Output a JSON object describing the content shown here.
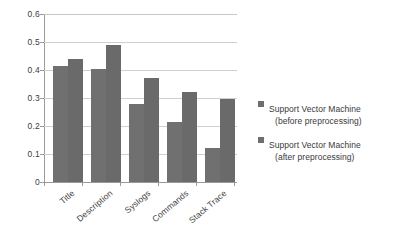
{
  "chart_data": {
    "type": "bar",
    "title": "",
    "xlabel": "",
    "ylabel": "",
    "categories": [
      "Title",
      "Description",
      "Syslogs",
      "Commands",
      "Stack Trace"
    ],
    "series": [
      {
        "name": "Support Vector Machine (before preprocessing)",
        "values": [
          0.415,
          0.405,
          0.28,
          0.215,
          0.12
        ]
      },
      {
        "name": "Support Vector Machine (after preprocessing)",
        "values": [
          0.44,
          0.49,
          0.37,
          0.32,
          0.295
        ]
      }
    ],
    "ylim": [
      0,
      0.6
    ],
    "ytick_labels": [
      "0.6",
      "0.5",
      "0.4",
      "0.3",
      "0.2",
      "0.1",
      "0"
    ],
    "ytick_values": [
      0.6,
      0.5,
      0.4,
      0.3,
      0.2,
      0.1,
      0
    ],
    "grid": true,
    "grid_axis": "y",
    "legend_position": "right",
    "bar_color": "#6e6e6e",
    "grid_color": "#cfcfcf",
    "axis_color": "#9a9a9a"
  },
  "legend": {
    "entries": [
      {
        "line1": "Support Vector Machine",
        "line2": "(before preprocessing)",
        "swatch_color": "#6e6e6e"
      },
      {
        "line1": "Support Vector Machine",
        "line2": "(after preprocessing)",
        "swatch_color": "#6e6e6e"
      }
    ]
  }
}
